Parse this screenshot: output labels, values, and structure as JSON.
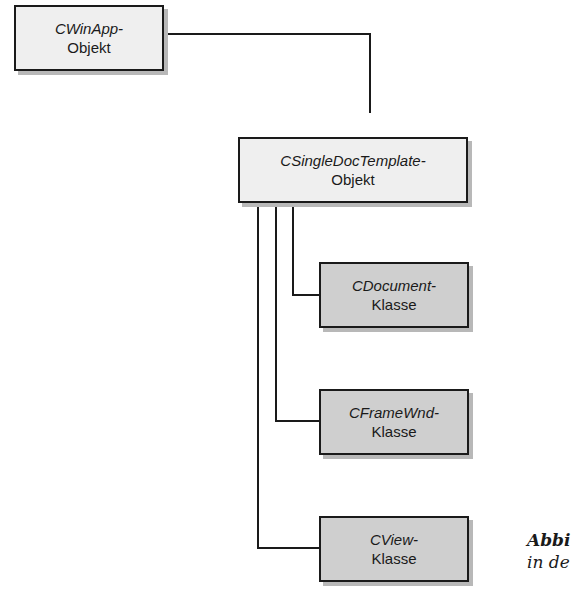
{
  "diagram": {
    "nodes": [
      {
        "id": "cwinapp",
        "line1": "CWinApp-",
        "line2": "Objekt"
      },
      {
        "id": "csingledoctemplate",
        "line1": "CSingleDocTemplate-",
        "line2": "Objekt"
      },
      {
        "id": "cdocument",
        "line1": "CDocument-",
        "line2": "Klasse"
      },
      {
        "id": "cframewnd",
        "line1": "CFrameWnd-",
        "line2": "Klasse"
      },
      {
        "id": "cview",
        "line1": "CView-",
        "line2": "Klasse"
      }
    ],
    "edges": [
      {
        "from": "cwinapp",
        "to": "csingledoctemplate"
      },
      {
        "from": "csingledoctemplate",
        "to": "cdocument"
      },
      {
        "from": "csingledoctemplate",
        "to": "cframewnd"
      },
      {
        "from": "csingledoctemplate",
        "to": "cview"
      }
    ],
    "caption": {
      "line1": "Abbi",
      "line2": "in de"
    },
    "colors": {
      "object_fill": "#efefef",
      "class_fill": "#cfcfcf",
      "stroke": "#1a1a1a"
    }
  }
}
